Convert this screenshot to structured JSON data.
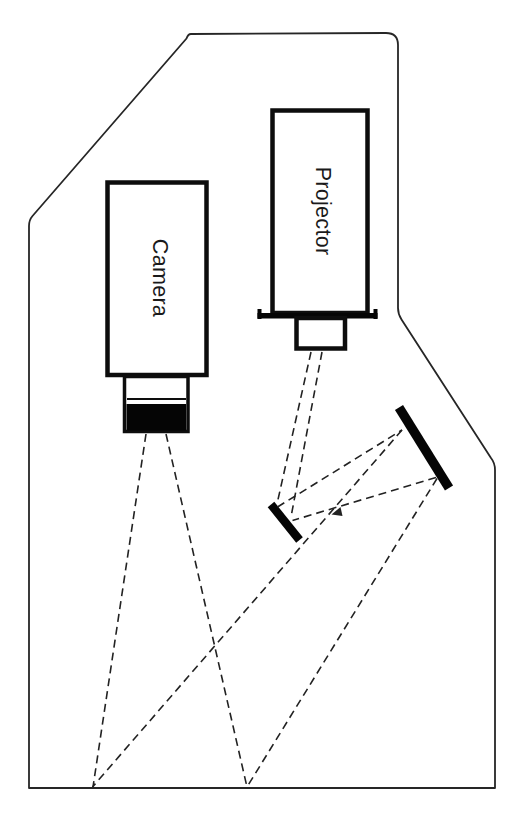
{
  "colors": {
    "background": "#ffffff",
    "line": "#1f1f1f",
    "solid_fill": "#050505"
  },
  "diagram": {
    "kind": "optical-schematic",
    "labels": {
      "camera": "Camera",
      "projector": "Projector"
    },
    "components": [
      {
        "name": "enclosure-outline"
      },
      {
        "name": "camera-body"
      },
      {
        "name": "camera-lens-assembly"
      },
      {
        "name": "projector-body"
      },
      {
        "name": "projector-mount-flange"
      },
      {
        "name": "projector-lens"
      },
      {
        "name": "small-fold-mirror"
      },
      {
        "name": "large-fold-mirror"
      },
      {
        "name": "projector-beam-rays"
      },
      {
        "name": "mirror-to-mirror-rays"
      },
      {
        "name": "mirror-to-floor-rays"
      },
      {
        "name": "camera-view-rays"
      }
    ]
  }
}
